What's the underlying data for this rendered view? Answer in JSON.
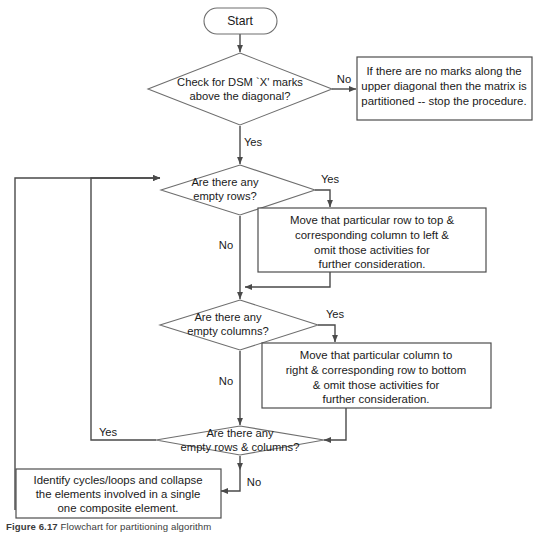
{
  "figure": {
    "caption_label": "Figure 6.17",
    "caption_text": "Flowchart for partitioning algorithm"
  },
  "nodes": {
    "start": {
      "type": "terminator",
      "label": "Start"
    },
    "decision_diagonal": {
      "type": "decision",
      "line1": "Check for  DSM `X' marks",
      "line2": "above the diagonal?"
    },
    "box_partitioned": {
      "type": "process",
      "line1": "If there are no marks along the",
      "line2": "upper diagonal then the matrix is",
      "line3": "partitioned -- stop the procedure."
    },
    "decision_empty_rows": {
      "type": "decision",
      "line1": "Are there any",
      "line2": "empty rows?"
    },
    "box_move_row": {
      "type": "process",
      "line1": "Move that particular row to top &",
      "line2": "corresponding column to left &",
      "line3": "omit those activities for",
      "line4": "further consideration."
    },
    "decision_empty_columns": {
      "type": "decision",
      "line1": "Are there any",
      "line2": "empty columns?"
    },
    "box_move_column": {
      "type": "process",
      "line1": "Move that particular column to",
      "line2": "right & corresponding row to bottom",
      "line3": "& omit those activities for",
      "line4": "further consideration."
    },
    "decision_empty_rows_columns": {
      "type": "decision",
      "line1": "Are there any",
      "line2": "empty rows & columns?"
    },
    "box_identify_cycles": {
      "type": "process",
      "line1": "Identify cycles/loops and collapse",
      "line2": "the elements involved in a single",
      "line3": "one composite element."
    }
  },
  "edge_labels": {
    "diagonal_no": "No",
    "diagonal_yes": "Yes",
    "rows_yes": "Yes",
    "rows_no": "No",
    "columns_yes": "Yes",
    "columns_no": "No",
    "rowscols_yes": "Yes",
    "rowscols_no": "No"
  },
  "colors": {
    "stroke": "#4a4a4a",
    "shape_stroke": "#6e6e6e",
    "background": "#ffffff",
    "text": "#1a1a1a"
  }
}
